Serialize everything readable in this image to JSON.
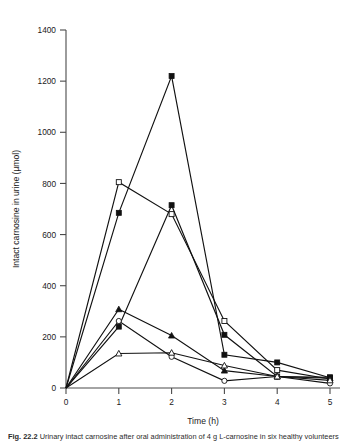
{
  "figure": {
    "background_color": "#ffffff",
    "line_color": "#111111",
    "axis_color": "#4a4a4a"
  },
  "caption": {
    "label": "Fig. 22.2",
    "text": "Urinary intact carnosine after oral administration of 4 g L-carnosine in six healthy volunteers"
  },
  "chart_data": {
    "type": "line",
    "title": "",
    "xlabel": "Time (h)",
    "ylabel": "Intact carnosine in urine (µmol)",
    "xlim": [
      0,
      5
    ],
    "ylim": [
      0,
      1400
    ],
    "xticks": [
      0,
      1,
      2,
      3,
      4,
      5
    ],
    "yticks": [
      0,
      200,
      400,
      600,
      800,
      1000,
      1200,
      1400
    ],
    "xtick_labels": [
      "0",
      "1",
      "2",
      "3",
      "4",
      "5"
    ],
    "ytick_labels": [
      "0",
      "200",
      "400",
      "600",
      "800",
      "1000",
      "1200",
      "1400"
    ],
    "grid": false,
    "legend": false,
    "legend_position": "none",
    "x": [
      0,
      1,
      2,
      3,
      4,
      5
    ],
    "series": [
      {
        "name": "Subject 1",
        "marker": "filled-square",
        "values": [
          0,
          685,
          1220,
          130,
          100,
          40
        ]
      },
      {
        "name": "Subject 2",
        "marker": "open-square",
        "values": [
          0,
          805,
          680,
          262,
          70,
          35
        ]
      },
      {
        "name": "Subject 3",
        "marker": "filled-square",
        "values": [
          0,
          240,
          715,
          208,
          45,
          42
        ]
      },
      {
        "name": "Subject 4",
        "marker": "filled-triangle",
        "values": [
          0,
          308,
          205,
          68,
          45,
          38
        ]
      },
      {
        "name": "Subject 5",
        "marker": "open-circle",
        "values": [
          0,
          262,
          122,
          28,
          45,
          18
        ]
      },
      {
        "name": "Subject 6",
        "marker": "open-triangle",
        "values": [
          0,
          135,
          138,
          88,
          45,
          30
        ]
      }
    ]
  }
}
